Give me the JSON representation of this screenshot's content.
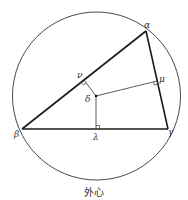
{
  "figure": {
    "caption": "外心",
    "colors": {
      "line": "#222222",
      "label": "#333333",
      "background": "#ffffff"
    }
  },
  "labels": {
    "alpha": "α",
    "beta": "β",
    "gamma": "γ",
    "delta": "δ",
    "nu": "ν",
    "mu": "μ",
    "lambda": "λ"
  },
  "geometry": {
    "circle": {
      "cx": 96.5,
      "cy": 96,
      "r": 84
    },
    "vertices": {
      "alpha": [
        146,
        31
      ],
      "beta": [
        22,
        129
      ],
      "gamma": [
        168,
        129
      ]
    },
    "circumcenter_delta": [
      96,
      96
    ],
    "feet": {
      "nu": [
        84,
        80
      ],
      "mu": [
        157,
        81
      ],
      "lambda": [
        96,
        129
      ]
    }
  }
}
